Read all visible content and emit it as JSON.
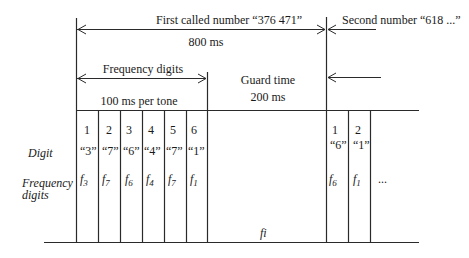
{
  "header": {
    "first_number_label": "First called number “376 471”",
    "first_number_duration": "800 ms",
    "second_number_label": "Second number “618 ...”"
  },
  "segments": {
    "frequency_digits_label": "Frequency digits",
    "per_tone_label": "100 ms per tone",
    "guard_time_label": "Guard time",
    "guard_time_duration": "200 ms"
  },
  "row_labels": {
    "digit": "Digit",
    "frequency_line1": "Frequency",
    "frequency_line2": "digits"
  },
  "first_number_tones": [
    {
      "index": "1",
      "digit": "“3”",
      "freq_base": "f",
      "freq_sub": "3"
    },
    {
      "index": "2",
      "digit": "“7”",
      "freq_base": "f",
      "freq_sub": "7"
    },
    {
      "index": "3",
      "digit": "“6”",
      "freq_base": "f",
      "freq_sub": "6"
    },
    {
      "index": "4",
      "digit": "“4”",
      "freq_base": "f",
      "freq_sub": "4"
    },
    {
      "index": "5",
      "digit": "“7”",
      "freq_base": "f",
      "freq_sub": "7"
    },
    {
      "index": "6",
      "digit": "“1”",
      "freq_base": "f",
      "freq_sub": "1"
    }
  ],
  "second_number_tones": [
    {
      "index": "1",
      "digit": "“6”",
      "freq_base": "f",
      "freq_sub": "6"
    },
    {
      "index": "2",
      "digit": "“1”",
      "freq_base": "f",
      "freq_sub": "1"
    }
  ],
  "continuation": "...",
  "guard_frequency_label": "fi"
}
